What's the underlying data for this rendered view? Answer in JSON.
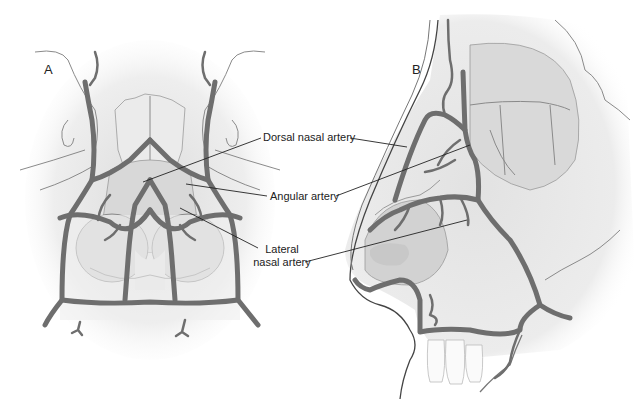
{
  "figure": {
    "panels": [
      {
        "id": "A",
        "label": "A",
        "view": "frontal"
      },
      {
        "id": "B",
        "label": "B",
        "view": "lateral"
      }
    ],
    "labels": [
      {
        "id": "dorsal-nasal-artery",
        "text": "Dorsal nasal artery"
      },
      {
        "id": "angular-artery",
        "text": "Angular artery"
      },
      {
        "id": "lateral-nasal-artery",
        "line1": "Lateral",
        "line2": "nasal artery"
      }
    ],
    "colors": {
      "artery": "#6e6e6e",
      "tissue_fill": "#e6e6e6",
      "cartilage_fill": "#cfcfcf",
      "leader_line": "#222222",
      "background": "#ffffff"
    }
  }
}
